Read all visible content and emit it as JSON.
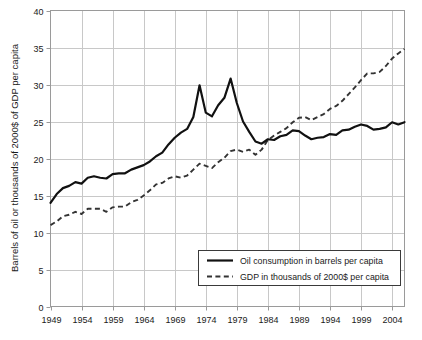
{
  "chart_data": {
    "type": "line",
    "title": "",
    "xlabel": "",
    "ylabel": "Barrels of oil or thousands of 2000$ of GDP per capita",
    "xlim": [
      1949,
      2006
    ],
    "ylim": [
      0,
      40
    ],
    "grid": true,
    "legend_position": "bottom-right",
    "x_tick_labels": [
      "1949",
      "1954",
      "1959",
      "1964",
      "1969",
      "1974",
      "1979",
      "1984",
      "1989",
      "1994",
      "1999",
      "2004"
    ],
    "x_ticks": [
      1949,
      1954,
      1959,
      1964,
      1969,
      1974,
      1979,
      1984,
      1989,
      1994,
      1999,
      2004
    ],
    "y_tick_labels": [
      "0",
      "5",
      "10",
      "15",
      "20",
      "25",
      "30",
      "35",
      "40"
    ],
    "y_ticks": [
      0,
      5,
      10,
      15,
      20,
      25,
      30,
      35,
      40
    ],
    "x": [
      1949,
      1950,
      1951,
      1952,
      1953,
      1954,
      1955,
      1956,
      1957,
      1958,
      1959,
      1960,
      1961,
      1962,
      1963,
      1964,
      1965,
      1966,
      1967,
      1968,
      1969,
      1970,
      1971,
      1972,
      1973,
      1974,
      1975,
      1976,
      1977,
      1978,
      1979,
      1980,
      1981,
      1982,
      1983,
      1984,
      1985,
      1986,
      1987,
      1988,
      1989,
      1990,
      1991,
      1992,
      1993,
      1994,
      1995,
      1996,
      1997,
      1998,
      1999,
      2000,
      2001,
      2002,
      2003,
      2004,
      2005,
      2006
    ],
    "series": [
      {
        "name": "Oil consumption in barrels per capita",
        "style": "solid",
        "color": "#111111",
        "values": [
          14.0,
          15.2,
          16.0,
          16.3,
          16.8,
          16.6,
          17.4,
          17.6,
          17.4,
          17.3,
          17.9,
          18.0,
          18.0,
          18.5,
          18.8,
          19.1,
          19.6,
          20.3,
          20.8,
          21.9,
          22.8,
          23.5,
          24.0,
          25.6,
          27.2,
          26.2,
          25.7,
          27.2,
          28.2,
          28.4,
          27.5,
          25.0,
          23.6,
          22.3,
          22.0,
          22.6,
          22.5,
          23.0,
          23.2,
          23.8,
          23.7,
          23.1,
          22.6,
          22.8,
          22.9,
          23.3,
          23.2,
          23.8,
          23.9,
          24.3,
          24.6,
          24.4,
          23.9,
          24.0,
          24.2,
          24.9,
          24.6,
          24.9
        ],
        "peaks": [
          {
            "year": 1973,
            "value": 29.9
          },
          {
            "year": 1978,
            "value": 30.8
          }
        ]
      },
      {
        "name": "GDP in thousands of 2000$ per capita",
        "style": "dashed",
        "color": "#333333",
        "values": [
          11.0,
          11.5,
          12.2,
          12.4,
          12.8,
          12.5,
          13.2,
          13.2,
          13.2,
          12.8,
          13.4,
          13.5,
          13.5,
          14.1,
          14.4,
          15.0,
          15.7,
          16.5,
          16.7,
          17.3,
          17.6,
          17.4,
          17.7,
          18.5,
          19.3,
          19.0,
          18.7,
          19.5,
          20.1,
          21.0,
          21.2,
          20.9,
          21.2,
          20.5,
          21.2,
          22.5,
          23.1,
          23.6,
          24.1,
          24.9,
          25.5,
          25.6,
          25.2,
          25.6,
          26.0,
          26.7,
          27.1,
          27.8,
          28.7,
          29.6,
          30.6,
          31.5,
          31.5,
          31.7,
          32.5,
          33.5,
          34.2,
          34.8
        ],
        "peaks": []
      }
    ]
  },
  "legend": {
    "items": [
      {
        "label": "Oil consumption in barrels per capita",
        "style": "solid"
      },
      {
        "label": "GDP in thousands of 2000$ per capita",
        "style": "dashed"
      }
    ]
  },
  "colors": {
    "oil_line": "#111111",
    "gdp_line": "#333333",
    "grid": "#c8c8c8",
    "frame": "#9a9a9a",
    "text": "#1a1a1a",
    "background": "#ffffff"
  }
}
